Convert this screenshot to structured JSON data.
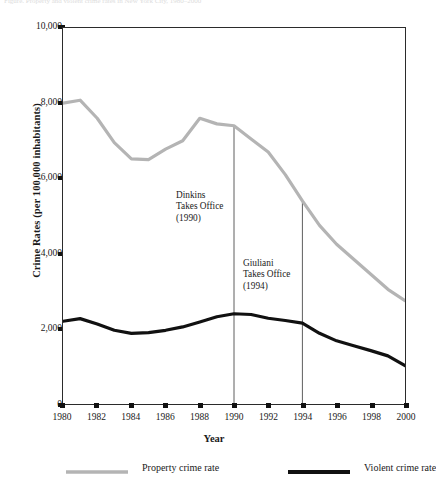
{
  "page": {
    "cropped_header_text": "Figure. Property and violent crime rates in New York City, 1980–2000"
  },
  "chart_data": {
    "type": "line",
    "title": "",
    "xlabel": "Year",
    "ylabel": "Crime Rates (per 100,000 inhabitants)",
    "xlim": [
      1980,
      2000
    ],
    "ylim": [
      0,
      10000
    ],
    "ytick_labels": [
      "10,000",
      "8,000",
      "6,000",
      "4,000",
      "2,000",
      "0"
    ],
    "ytick_values": [
      10000,
      8000,
      6000,
      4000,
      2000,
      0
    ],
    "xtick_labels": [
      "1980",
      "1982",
      "1984",
      "1986",
      "1988",
      "1990",
      "1992",
      "1994",
      "1996",
      "1998",
      "2000"
    ],
    "xtick_values": [
      1980,
      1982,
      1984,
      1986,
      1988,
      1990,
      1992,
      1994,
      1996,
      1998,
      2000
    ],
    "grid": false,
    "legend_position": "below-plot",
    "x": [
      1980,
      1981,
      1982,
      1983,
      1984,
      1985,
      1986,
      1987,
      1988,
      1989,
      1990,
      1991,
      1992,
      1993,
      1994,
      1995,
      1996,
      1997,
      1998,
      1999,
      2000
    ],
    "series": [
      {
        "name": "Property crime rate",
        "color": "#b4b4b4",
        "line_width": 3.2,
        "values": [
          8000,
          8080,
          7600,
          6950,
          6520,
          6500,
          6780,
          7000,
          7600,
          7450,
          7400,
          7050,
          6700,
          6100,
          5400,
          4750,
          4250,
          3850,
          3450,
          3050,
          2750
        ]
      },
      {
        "name": "Violent crime rate",
        "color": "#111111",
        "line_width": 3.2,
        "values": [
          2200,
          2270,
          2130,
          1960,
          1880,
          1900,
          1960,
          2050,
          2180,
          2320,
          2400,
          2380,
          2280,
          2220,
          2150,
          1880,
          1680,
          1550,
          1420,
          1280,
          1020
        ]
      }
    ],
    "annotations": [
      {
        "id": "dinkins",
        "text_lines": [
          "Dinkins",
          "Takes Office",
          "(1990)"
        ],
        "marker_year": 1990,
        "marker_top_value": 7400,
        "marker_bottom_value": 0
      },
      {
        "id": "giuliani",
        "text_lines": [
          "Giuliani",
          "Takes Office",
          "(1994)"
        ],
        "marker_year": 1994,
        "marker_top_value": 5400,
        "marker_bottom_value": 0
      }
    ]
  },
  "legend": {
    "items": [
      {
        "label": "Property crime rate",
        "color": "#b4b4b4"
      },
      {
        "label": "Violent crime rate",
        "color": "#111111"
      }
    ]
  }
}
